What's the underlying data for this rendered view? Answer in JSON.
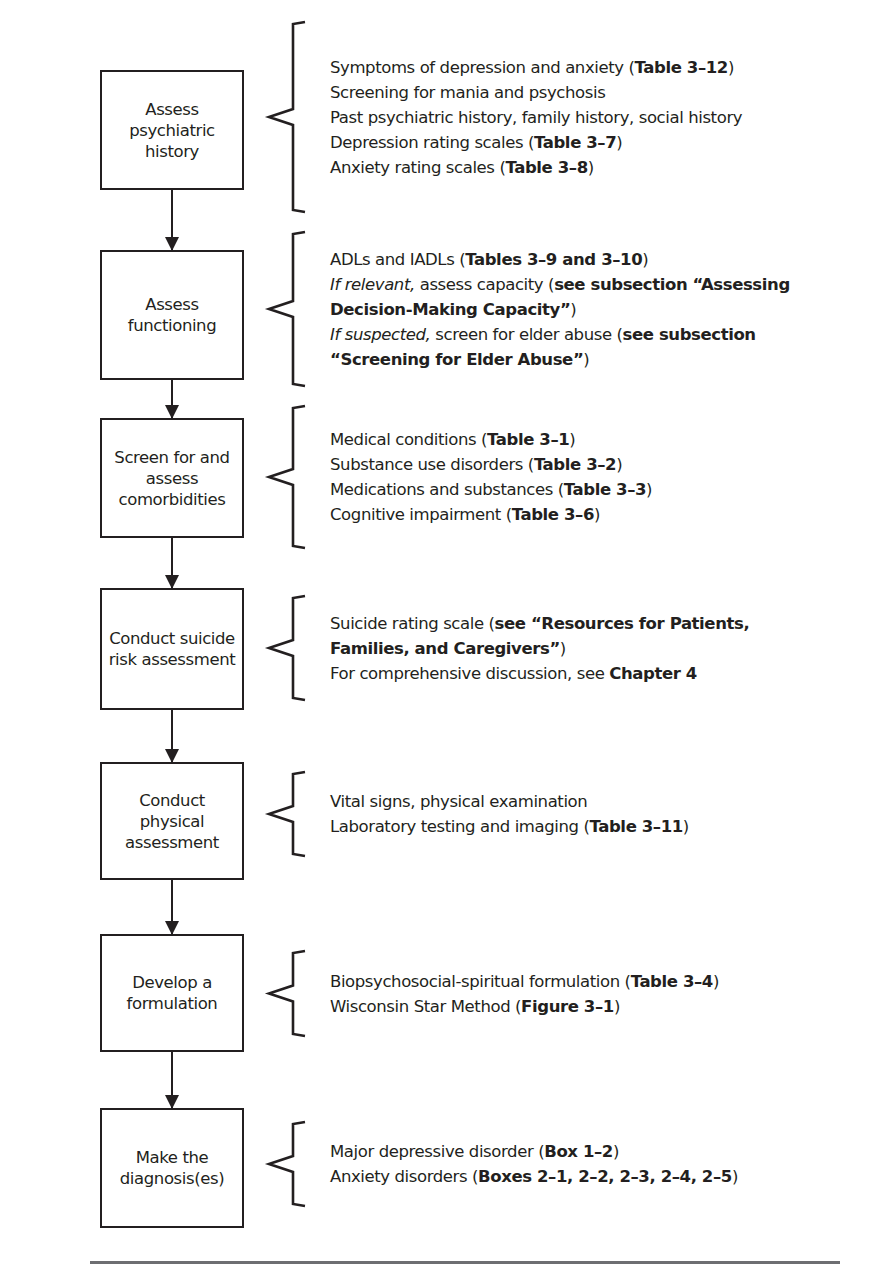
{
  "steps": [
    {
      "label": "Assess psychiatric history",
      "label_lines": [
        "Assess psychiatric",
        "history"
      ],
      "items": [
        [
          {
            "t": "Symptoms of depression and anxiety "
          },
          {
            "t": "(",
            "s": "n"
          },
          {
            "t": "Table 3–12",
            "s": "b"
          },
          {
            "t": ")"
          }
        ],
        [
          {
            "t": "Screening for mania and psychosis"
          }
        ],
        [
          {
            "t": "Past psychiatric history, family history, social history"
          }
        ],
        [
          {
            "t": "Depression rating scales ("
          },
          {
            "t": "Table 3–7",
            "s": "b"
          },
          {
            "t": ")"
          }
        ],
        [
          {
            "t": "Anxiety rating scales ("
          },
          {
            "t": "Table 3–8",
            "s": "b"
          },
          {
            "t": ")"
          }
        ]
      ]
    },
    {
      "label": "Assess functioning",
      "label_lines": [
        "Assess",
        "functioning"
      ],
      "items": [
        [
          {
            "t": "ADLs and IADLs ("
          },
          {
            "t": "Tables 3–9 and 3–10",
            "s": "b"
          },
          {
            "t": ")"
          }
        ],
        [
          {
            "t": "If relevant,",
            "s": "i"
          },
          {
            "t": " assess capacity ("
          },
          {
            "t": "see subsection “Assessing",
            "s": "b"
          }
        ],
        [
          {
            "t": "Decision-Making Capacity”",
            "s": "b"
          },
          {
            "t": ")"
          }
        ],
        [
          {
            "t": "If suspected,",
            "s": "i"
          },
          {
            "t": " screen for elder abuse ("
          },
          {
            "t": "see subsection",
            "s": "b"
          }
        ],
        [
          {
            "t": "“Screening for Elder Abuse”",
            "s": "b"
          },
          {
            "t": ")"
          }
        ]
      ]
    },
    {
      "label": "Screen for and assess comorbidities",
      "label_lines": [
        "Screen for and",
        "assess",
        "comorbidities"
      ],
      "items": [
        [
          {
            "t": "Medical conditions ("
          },
          {
            "t": "Table 3–1",
            "s": "b"
          },
          {
            "t": ")"
          }
        ],
        [
          {
            "t": "Substance use disorders ("
          },
          {
            "t": "Table 3–2",
            "s": "b"
          },
          {
            "t": ")"
          }
        ],
        [
          {
            "t": "Medications and substances ("
          },
          {
            "t": "Table 3–3",
            "s": "b"
          },
          {
            "t": ")"
          }
        ],
        [
          {
            "t": "Cognitive impairment ("
          },
          {
            "t": "Table 3–6",
            "s": "b"
          },
          {
            "t": ")"
          }
        ]
      ]
    },
    {
      "label": "Conduct suicide risk assessment",
      "label_lines": [
        "Conduct suicide",
        "risk assessment"
      ],
      "items": [
        [
          {
            "t": "Suicide rating scale ("
          },
          {
            "t": "see “Resources for Patients,",
            "s": "b"
          }
        ],
        [
          {
            "t": "Families, and Caregivers”",
            "s": "b"
          },
          {
            "t": ")"
          }
        ],
        [
          {
            "t": "For comprehensive discussion, see "
          },
          {
            "t": "Chapter 4",
            "s": "b"
          }
        ]
      ]
    },
    {
      "label": "Conduct physical assessment",
      "label_lines": [
        "Conduct physical",
        "assessment"
      ],
      "items": [
        [
          {
            "t": "Vital signs, physical examination"
          }
        ],
        [
          {
            "t": "Laboratory testing and imaging ("
          },
          {
            "t": "Table 3–11",
            "s": "b"
          },
          {
            "t": ")"
          }
        ]
      ]
    },
    {
      "label": "Develop a formulation",
      "label_lines": [
        "Develop a",
        "formulation"
      ],
      "items": [
        [
          {
            "t": "Biopsychosocial-spiritual formulation ("
          },
          {
            "t": "Table 3–4",
            "s": "b"
          },
          {
            "t": ")"
          }
        ],
        [
          {
            "t": "Wisconsin Star Method ("
          },
          {
            "t": "Figure 3–1",
            "s": "b"
          },
          {
            "t": ")"
          }
        ]
      ]
    },
    {
      "label": "Make the diagnosis(es)",
      "label_lines": [
        "Make the",
        "diagnosis(es)"
      ],
      "items": [
        [
          {
            "t": "Major depressive disorder ("
          },
          {
            "t": "Box 1–2",
            "s": "b"
          },
          {
            "t": ")"
          }
        ],
        [
          {
            "t": "Anxiety disorders ("
          },
          {
            "t": "Boxes 2–1, 2–2, 2–3, 2–4, 2–5",
            "s": "b"
          },
          {
            "t": ")"
          }
        ]
      ]
    }
  ],
  "colors": {
    "ink": "#231f20",
    "rule": "#6d6e71",
    "background": "#ffffff"
  }
}
